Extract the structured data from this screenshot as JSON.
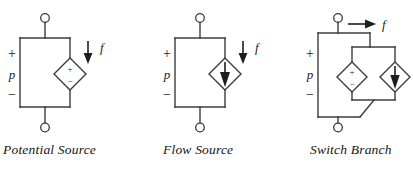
{
  "figure": {
    "width": 413,
    "height": 172,
    "background": "#ffffff",
    "line_color": "#3c3c3c",
    "text_color": "#141414"
  },
  "diagrams": [
    {
      "id": "potential-source",
      "caption": "Potential Source",
      "effort_label": "p",
      "plus_sign": "+",
      "minus_sign": "−",
      "flow_label": "f",
      "flow_arrow_direction": "down",
      "element_count": 1,
      "elements": [
        {
          "kind": "diamond",
          "interior": "plus-minus",
          "top_symbol": "+",
          "bottom_symbol": "−"
        }
      ],
      "has_switch": false
    },
    {
      "id": "flow-source",
      "caption": "Flow Source",
      "effort_label": "p",
      "plus_sign": "+",
      "minus_sign": "−",
      "flow_label": "f",
      "flow_arrow_direction": "down",
      "element_count": 1,
      "elements": [
        {
          "kind": "diamond",
          "interior": "filled-arrow",
          "arrow_direction": "down"
        }
      ],
      "has_switch": false
    },
    {
      "id": "switch-branch",
      "caption": "Switch Branch",
      "effort_label": "p",
      "plus_sign": "+",
      "minus_sign": "−",
      "flow_label": "f",
      "flow_arrow_direction": "right",
      "element_count": 2,
      "elements": [
        {
          "kind": "diamond",
          "interior": "plus-minus",
          "top_symbol": "+",
          "bottom_symbol": "−"
        },
        {
          "kind": "diamond",
          "interior": "filled-arrow",
          "arrow_direction": "down"
        }
      ],
      "has_switch": true
    }
  ]
}
